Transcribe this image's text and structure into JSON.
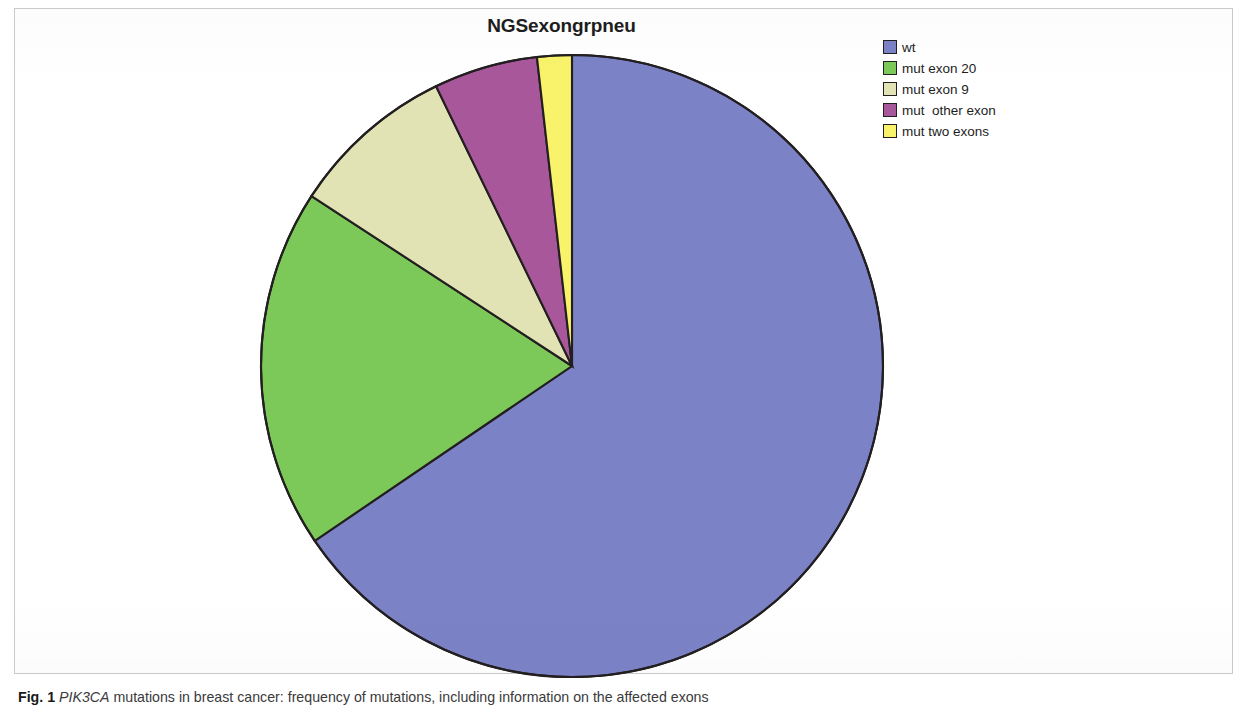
{
  "figure": {
    "caption_number": "Fig. 1",
    "caption_gene": "PIK3CA",
    "caption_text": " mutations in breast cancer: frequency of mutations, including information on the affected exons"
  },
  "chart": {
    "title": "NGSexongrpneu"
  },
  "legend": {
    "items": [
      {
        "label": "wt",
        "color": "#7b82c6"
      },
      {
        "label": "mut exon 20",
        "color": "#7cc959"
      },
      {
        "label": "mut exon 9",
        "color": "#e1e3b4"
      },
      {
        "label": "mut  other exon",
        "color": "#a8579b"
      },
      {
        "label": "mut two exons",
        "color": "#f8f36a"
      }
    ]
  },
  "chart_data": {
    "type": "pie",
    "title": "NGSexongrpneu",
    "categories": [
      "wt",
      "mut exon 20",
      "mut exon 9",
      "mut  other exon",
      "mut two exons"
    ],
    "values": [
      65.5,
      18.7,
      8.6,
      5.4,
      1.8
    ],
    "value_unit": "percent",
    "colors": [
      "#7b82c6",
      "#7cc959",
      "#e1e3b4",
      "#a8579b",
      "#f8f36a"
    ],
    "start_angle_deg": 0,
    "direction": "clockwise",
    "slice_angles_deg": [
      235.8,
      67.3,
      31.0,
      19.4,
      6.5
    ],
    "slice_boundaries_deg": [
      0,
      235.8,
      303.1,
      334.1,
      353.5,
      360
    ],
    "legend_position": "top-right",
    "grid": false,
    "xlabel": "",
    "ylabel": "",
    "data_labels": false,
    "stroke_color": "#231f20"
  }
}
